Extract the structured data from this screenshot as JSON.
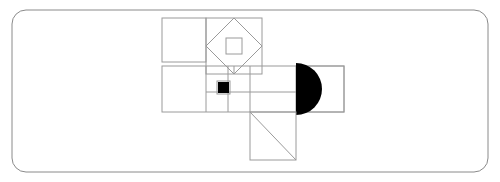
{
  "canvas": {
    "width": 500,
    "height": 182,
    "background_color": "#ffffff"
  },
  "frame": {
    "name": "rounded-rectangle-border",
    "x": 12,
    "y": 10,
    "width": 476,
    "height": 162,
    "corner_radius": 14,
    "stroke_color": "#8a8a8a",
    "stroke_width": 1
  },
  "style": {
    "outline_color": "#9a9a9a",
    "outline_width": 1,
    "fill_black": "#000000"
  },
  "shapes": [
    {
      "id": "top-left-rectangle",
      "type": "rect",
      "x": 162,
      "y": 18,
      "width": 44,
      "height": 44,
      "fill": "none"
    },
    {
      "id": "diamond-host-square",
      "type": "rect",
      "x": 206,
      "y": 18,
      "width": 56,
      "height": 56,
      "fill": "none"
    },
    {
      "id": "inscribed-diamond",
      "type": "polygon",
      "points": "234,18 262,46 234,74 206,46",
      "fill": "none"
    },
    {
      "id": "diamond-center-small-square",
      "type": "rect",
      "x": 226,
      "y": 38,
      "width": 16,
      "height": 16,
      "fill": "none"
    },
    {
      "id": "horizontal-band-rectangle",
      "type": "rect",
      "x": 162,
      "y": 66,
      "width": 182,
      "height": 46,
      "fill": "none"
    },
    {
      "id": "band-vertical-divider-left",
      "type": "line",
      "x1": 206,
      "y1": 66,
      "x2": 206,
      "y2": 112
    },
    {
      "id": "band-vertical-divider-mid",
      "type": "line",
      "x1": 228,
      "y1": 66,
      "x2": 228,
      "y2": 112
    },
    {
      "id": "band-vertical-divider-right",
      "type": "line",
      "x1": 250,
      "y1": 66,
      "x2": 250,
      "y2": 112
    },
    {
      "id": "band-inner-horizontal-line",
      "type": "line",
      "x1": 206,
      "y1": 92,
      "x2": 296,
      "y2": 92
    },
    {
      "id": "black-filled-square",
      "type": "rect",
      "x": 218,
      "y": 82,
      "width": 11,
      "height": 11,
      "fill": "#000000"
    },
    {
      "id": "black-square-outline",
      "type": "rect",
      "x": 217,
      "y": 81,
      "width": 13,
      "height": 13,
      "fill": "none"
    },
    {
      "id": "right-panel-rectangle",
      "type": "rect",
      "x": 296,
      "y": 66,
      "width": 48,
      "height": 46,
      "fill": "none"
    },
    {
      "id": "black-half-disc",
      "type": "semicircle",
      "flat_edge_x": 296,
      "center_y": 89,
      "radius": 26,
      "bulge_direction": "right",
      "fill": "#000000"
    },
    {
      "id": "bottom-square",
      "type": "rect",
      "x": 250,
      "y": 112,
      "width": 46,
      "height": 48,
      "fill": "none"
    },
    {
      "id": "bottom-square-diagonal",
      "type": "line",
      "x1": 250,
      "y1": 112,
      "x2": 296,
      "y2": 160
    },
    {
      "id": "diamond-stem-vertical",
      "type": "line",
      "x1": 234,
      "y1": 74,
      "x2": 234,
      "y2": 66
    }
  ],
  "labels": {
    "title": "",
    "caption": ""
  }
}
